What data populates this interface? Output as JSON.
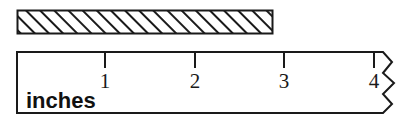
{
  "figure": {
    "background_color": "#ffffff",
    "line_color": "#1a1a1a"
  },
  "measured_object": {
    "name": "hatched-bar",
    "fill_pattern": "diagonal-hatch",
    "hatch_color": "#1a1a1a",
    "fill_color": "#ffffff",
    "x": 17,
    "y": 10,
    "width": 256,
    "height": 24
  },
  "ruler": {
    "unit_label": "inches",
    "x": 16,
    "y": 51,
    "width": 384,
    "height": 63,
    "origin_x": 16,
    "pixels_per_inch": 89.4,
    "broken_end": true,
    "ticks": [
      {
        "label": "1",
        "value": 1,
        "x": 105
      },
      {
        "label": "2",
        "value": 2,
        "x": 195
      },
      {
        "label": "3",
        "value": 3,
        "x": 284
      },
      {
        "label": "4",
        "value": 4,
        "x": 374
      }
    ]
  }
}
